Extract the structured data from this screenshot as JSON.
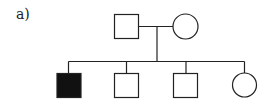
{
  "figure": {
    "label": "a)",
    "type": "pedigree",
    "colors": {
      "line": "#222222",
      "affected": "#111111",
      "unaffected": "#ffffff"
    }
  },
  "generations": [
    {
      "id": "I",
      "members": [
        {
          "id": "I-1",
          "sex": "male",
          "shape": "square",
          "affected": false
        },
        {
          "id": "I-2",
          "sex": "female",
          "shape": "circle",
          "affected": false
        }
      ]
    },
    {
      "id": "II",
      "members": [
        {
          "id": "II-1",
          "sex": "male",
          "shape": "square",
          "affected": true
        },
        {
          "id": "II-2",
          "sex": "male",
          "shape": "square",
          "affected": false
        },
        {
          "id": "II-3",
          "sex": "male",
          "shape": "square",
          "affected": false
        },
        {
          "id": "II-4",
          "sex": "female",
          "shape": "circle",
          "affected": false
        }
      ]
    }
  ]
}
